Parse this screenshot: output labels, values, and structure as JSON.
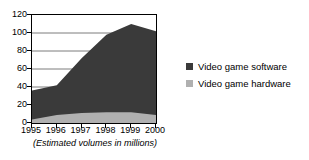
{
  "chart_data": {
    "type": "area",
    "stacked": true,
    "title": "",
    "subtitle": "",
    "caption": "(Estimated volumes in millions)",
    "xlabel": "",
    "ylabel": "",
    "x": [
      1995,
      1996,
      1997,
      1998,
      1999,
      2000
    ],
    "categories": [
      "1995",
      "1996",
      "1997",
      "1998",
      "1999",
      "2000"
    ],
    "xtick_labels": [
      "1995",
      "1996",
      "1997",
      "1998",
      "1999",
      "2000"
    ],
    "ytick_labels": [
      "0",
      "20",
      "40",
      "60",
      "80",
      "100",
      "120"
    ],
    "yticks": [
      0,
      20,
      40,
      60,
      80,
      100,
      120
    ],
    "ylim": [
      0,
      120
    ],
    "xlim": [
      1995,
      2000
    ],
    "grid": true,
    "grid_axis": "y",
    "legend_position": "right",
    "series": [
      {
        "name": "Video game software",
        "color": "#3a3a3a",
        "values": [
          32,
          33,
          61,
          86,
          98,
          93
        ]
      },
      {
        "name": "Video game hardware",
        "color": "#b0b0b0",
        "values": [
          4,
          9,
          11,
          12,
          12,
          9
        ]
      }
    ],
    "stack_totals": [
      36,
      42,
      72,
      98,
      110,
      102
    ]
  },
  "legend": {
    "items": [
      {
        "label": "Video game software",
        "color": "#3a3a3a",
        "swatch": "square-swatch"
      },
      {
        "label": "Video game hardware",
        "color": "#b0b0b0",
        "swatch": "square-swatch"
      }
    ]
  },
  "axes": {
    "y_labels": [
      "120",
      "100",
      "80",
      "60",
      "40",
      "20",
      "0"
    ],
    "x_labels": [
      "1995",
      "1996",
      "1997",
      "1998",
      "1999",
      "2000"
    ]
  },
  "caption": {
    "text": "(Estimated volumes in millions)"
  },
  "colors": {
    "software": "#3a3a3a",
    "hardware": "#b0b0b0",
    "axis": "#000000",
    "grid": "#7d7d7d",
    "background": "#ffffff"
  }
}
